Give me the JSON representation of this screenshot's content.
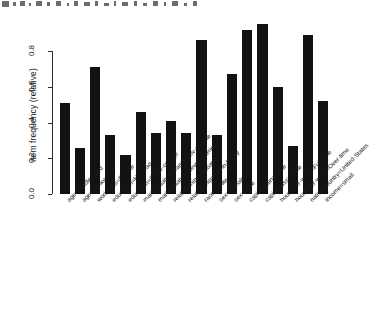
{
  "chart_data": {
    "type": "bar",
    "title": "",
    "subtitle": "",
    "xlabel": "",
    "ylabel": "item frequency (relative)",
    "ylim": [
      0.0,
      0.9
    ],
    "yticks": [
      "0.0",
      "0.2",
      "0.4",
      "0.6",
      "0.8"
    ],
    "ytick_values": [
      0.0,
      0.2,
      0.4,
      0.6,
      0.8
    ],
    "grid": false,
    "legend": null,
    "bar_color": "#121212",
    "axis_color": "#2a2a2a",
    "categories": [
      "age=Middle-aged",
      "age=Senior",
      "workclass=Private",
      "education=HS-grad",
      "education=Some-college",
      "marital-status=Married-civ-spouse",
      "marital-status=Never-married",
      "relationship=Husband",
      "relationship=Not-in-family",
      "race=White",
      "sex=Female",
      "sex=Male",
      "capital-gain=None",
      "capital-loss=None",
      "hours-per-week=Full-time",
      "hours-per-week=Over-time",
      "native-country=United-States",
      "income=small"
    ],
    "values": [
      0.51,
      0.26,
      0.71,
      0.33,
      0.22,
      0.46,
      0.34,
      0.41,
      0.34,
      0.86,
      0.33,
      0.67,
      0.92,
      0.95,
      0.6,
      0.27,
      0.89,
      0.52
    ]
  },
  "axis": {
    "y_title": "item frequency (relative)"
  },
  "noise": {
    "marks": [
      {
        "x": 2,
        "y": 1,
        "w": 7,
        "h": 6
      },
      {
        "x": 13,
        "y": 2,
        "w": 3,
        "h": 4
      },
      {
        "x": 20,
        "y": 1,
        "w": 5,
        "h": 5
      },
      {
        "x": 29,
        "y": 3,
        "w": 2,
        "h": 3
      },
      {
        "x": 36,
        "y": 1,
        "w": 6,
        "h": 5
      },
      {
        "x": 47,
        "y": 2,
        "w": 3,
        "h": 4
      },
      {
        "x": 56,
        "y": 1,
        "w": 5,
        "h": 5
      },
      {
        "x": 67,
        "y": 3,
        "w": 2,
        "h": 3
      },
      {
        "x": 74,
        "y": 1,
        "w": 4,
        "h": 5
      },
      {
        "x": 84,
        "y": 2,
        "w": 6,
        "h": 4
      },
      {
        "x": 95,
        "y": 1,
        "w": 3,
        "h": 5
      },
      {
        "x": 104,
        "y": 3,
        "w": 5,
        "h": 3
      },
      {
        "x": 114,
        "y": 1,
        "w": 2,
        "h": 5
      },
      {
        "x": 122,
        "y": 2,
        "w": 6,
        "h": 4
      },
      {
        "x": 134,
        "y": 1,
        "w": 3,
        "h": 5
      },
      {
        "x": 143,
        "y": 3,
        "w": 4,
        "h": 3
      },
      {
        "x": 153,
        "y": 1,
        "w": 5,
        "h": 5
      },
      {
        "x": 164,
        "y": 2,
        "w": 2,
        "h": 4
      },
      {
        "x": 172,
        "y": 1,
        "w": 6,
        "h": 5
      },
      {
        "x": 184,
        "y": 3,
        "w": 3,
        "h": 3
      },
      {
        "x": 193,
        "y": 1,
        "w": 4,
        "h": 5
      }
    ]
  }
}
